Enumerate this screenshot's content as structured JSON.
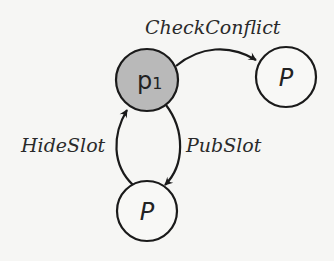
{
  "diagram": {
    "background": "#f6f6f4",
    "stroke_color": "#1a1a1a",
    "nodes": [
      {
        "id": "p1",
        "label": "p",
        "subscript": "1",
        "fill": "#b9b9b9",
        "cx": 147,
        "cy": 80,
        "r": 31
      },
      {
        "id": "p_right",
        "label": "P",
        "fill": "#f8f8f6",
        "cx": 286,
        "cy": 77,
        "r": 30
      },
      {
        "id": "p_bottom",
        "label": "P",
        "fill": "#f8f8f6",
        "cx": 147,
        "cy": 211,
        "r": 30
      }
    ],
    "edges": [
      {
        "from": "p1",
        "to": "p_right",
        "label": "CheckConflict"
      },
      {
        "from": "p1",
        "to": "p_bottom",
        "label": "PubSlot"
      },
      {
        "from": "p_bottom",
        "to": "p1",
        "label": "HideSlot"
      }
    ]
  }
}
